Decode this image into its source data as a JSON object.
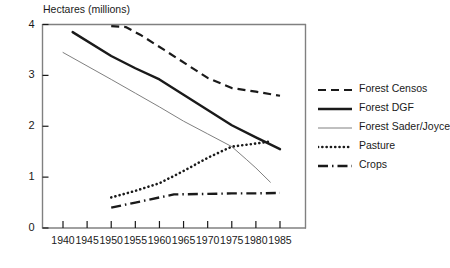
{
  "chart_data": {
    "type": "line",
    "title": "",
    "ylabel": "Hectares (millions)",
    "xlabel": "",
    "xlim": [
      1938,
      1987
    ],
    "ylim": [
      0,
      4
    ],
    "grid": false,
    "legend_position": "right",
    "xticks": [
      1940,
      1945,
      1950,
      1955,
      1960,
      1965,
      1970,
      1975,
      1980,
      1985
    ],
    "yticks": [
      0,
      1,
      2,
      3,
      4
    ],
    "series": [
      {
        "name": "Forest Censos",
        "style": "dashed",
        "color": "#1a1a1a",
        "x": [
          1950,
          1953,
          1956,
          1961,
          1970,
          1975,
          1980,
          1985
        ],
        "values": [
          3.97,
          3.95,
          3.8,
          3.5,
          2.95,
          2.75,
          2.68,
          2.6
        ]
      },
      {
        "name": "Forest DGF",
        "style": "solid",
        "color": "#1a1a1a",
        "x": [
          1942,
          1950,
          1955,
          1960,
          1965,
          1970,
          1975,
          1980,
          1985
        ],
        "values": [
          3.85,
          3.38,
          3.14,
          2.92,
          2.62,
          2.32,
          2.02,
          1.78,
          1.55
        ]
      },
      {
        "name": "Forest Sader/Joyce",
        "style": "thin-solid",
        "color": "#808080",
        "x": [
          1940,
          1950,
          1955,
          1960,
          1965,
          1970,
          1975,
          1978,
          1980,
          1983
        ],
        "values": [
          3.45,
          2.92,
          2.65,
          2.38,
          2.1,
          1.85,
          1.6,
          1.35,
          1.18,
          0.9
        ]
      },
      {
        "name": "Pasture",
        "style": "dotted",
        "color": "#1a1a1a",
        "x": [
          1950,
          1955,
          1960,
          1965,
          1970,
          1975,
          1980,
          1983
        ],
        "values": [
          0.6,
          0.73,
          0.88,
          1.12,
          1.38,
          1.6,
          1.66,
          1.7
        ]
      },
      {
        "name": "Crops",
        "style": "dash-dot",
        "color": "#1a1a1a",
        "x": [
          1950,
          1955,
          1960,
          1963,
          1970,
          1975,
          1980,
          1985
        ],
        "values": [
          0.4,
          0.5,
          0.6,
          0.66,
          0.67,
          0.68,
          0.68,
          0.69
        ]
      }
    ]
  },
  "axis": {
    "y_title": "Hectares (millions)",
    "y_ticks": [
      "4",
      "3",
      "2",
      "1",
      "0"
    ],
    "x_ticks": [
      "1940",
      "1945",
      "1950",
      "1955",
      "1960",
      "1965",
      "1970",
      "1975",
      "1980",
      "1985"
    ]
  },
  "legend": {
    "items": [
      {
        "label": "Forest Censos",
        "style": "dashed"
      },
      {
        "label": "Forest DGF",
        "style": "solid"
      },
      {
        "label": "Forest Sader/Joyce",
        "style": "thin-solid"
      },
      {
        "label": "Pasture",
        "style": "dotted"
      },
      {
        "label": "Crops",
        "style": "dash-dot"
      }
    ]
  },
  "colors": {
    "ink": "#1a1a1a",
    "grey": "#808080",
    "background": "#ffffff"
  }
}
